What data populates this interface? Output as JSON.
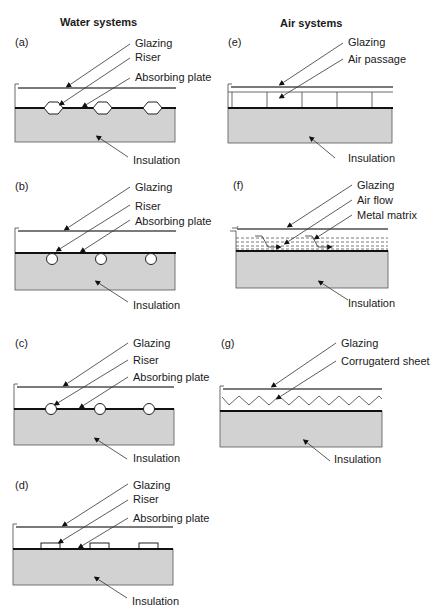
{
  "figure": {
    "columns": {
      "water": {
        "title": "Water systems"
      },
      "air": {
        "title": "Air systems"
      }
    },
    "panels": {
      "a": {
        "tag": "(a)",
        "glazing": "Glazing",
        "riser": "Riser",
        "absorber": "Absorbing plate",
        "insulation": "Insulation",
        "riser_shape": "hexagon"
      },
      "b": {
        "tag": "(b)",
        "glazing": "Glazing",
        "riser": "Riser",
        "absorber": "Absorbing plate",
        "insulation": "Insulation",
        "riser_shape": "circle-below-plate"
      },
      "c": {
        "tag": "(c)",
        "glazing": "Glazing",
        "riser": "Riser",
        "absorber": "Absorbing plate",
        "insulation": "Insulation",
        "riser_shape": "circle-on-plate"
      },
      "d": {
        "tag": "(d)",
        "glazing": "Glazing",
        "riser": "Riser",
        "absorber": "Absorbing plate",
        "insulation": "Insulation",
        "riser_shape": "rectangle"
      },
      "e": {
        "tag": "(e)",
        "glazing": "Glazing",
        "passage": "Air passage",
        "insulation": "Insulation"
      },
      "f": {
        "tag": "(f)",
        "glazing": "Glazing",
        "flow": "Air flow",
        "matrix": "Metal matrix",
        "insulation": "Insulation"
      },
      "g": {
        "tag": "(g)",
        "glazing": "Glazing",
        "sheet": "Corrugaterd sheet",
        "insulation": "Insulation"
      }
    },
    "colors": {
      "insulation": "#d2d2d2",
      "glazing": "#7a7a7a",
      "absorber": "#111111"
    }
  }
}
